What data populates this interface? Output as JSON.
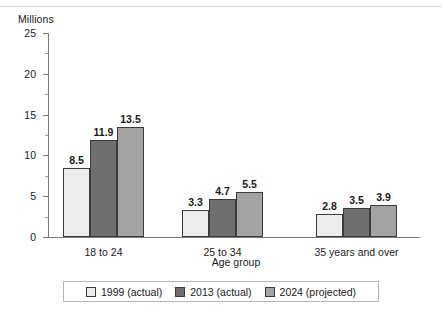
{
  "chart_data": {
    "type": "bar",
    "title": "",
    "subtitle": "",
    "unit_label": "Millions",
    "xlabel": "Age group",
    "ylabel": "",
    "categories": [
      "18 to 24",
      "25 to 34",
      "35 years and over"
    ],
    "series": [
      {
        "name": "1999 (actual)",
        "values": [
          8.5,
          3.3,
          2.8
        ],
        "color": "#ececec"
      },
      {
        "name": "2013 (actual)",
        "values": [
          11.9,
          4.7,
          3.5
        ],
        "color": "#6f6f6f"
      },
      {
        "name": "2024 (projected)",
        "values": [
          13.5,
          5.5,
          3.9
        ],
        "color": "#a3a3a3"
      }
    ],
    "ylim": [
      0,
      25
    ],
    "y_ticks": [
      0,
      5,
      10,
      15,
      20,
      25
    ],
    "y_tick_labels": [
      "0",
      "5",
      "10",
      "15",
      "20",
      "25"
    ],
    "y_minor_ticks": [
      2.5,
      7.5,
      12.5,
      17.5,
      22.5
    ],
    "grid": false,
    "legend_position": "bottom",
    "value_labels": true
  },
  "legend": {
    "items": [
      {
        "label": "1999 (actual)",
        "color": "#ececec"
      },
      {
        "label": "2013 (actual)",
        "color": "#6f6f6f"
      },
      {
        "label": "2024 (projected)",
        "color": "#a3a3a3"
      }
    ]
  },
  "colors": {
    "axis": "#7a7a7a",
    "bar_outline": "#3b3b3b",
    "text": "#1a1a1a",
    "rule": "#d9d9d9",
    "legend_border": "#b5b5b5"
  }
}
